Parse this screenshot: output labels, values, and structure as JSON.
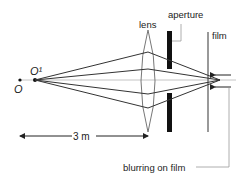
{
  "diagram": {
    "labels": {
      "object": "O",
      "image_object": "O¹",
      "lens": "lens",
      "aperture": "aperture",
      "film": "film",
      "distance": "3 m",
      "blurring": "blurring on film"
    },
    "colors": {
      "ray": "#333333",
      "axis": "#bbbbbb",
      "lens": "#777777",
      "aperture": "#111111",
      "film": "#555555",
      "leader": "#999999"
    }
  }
}
